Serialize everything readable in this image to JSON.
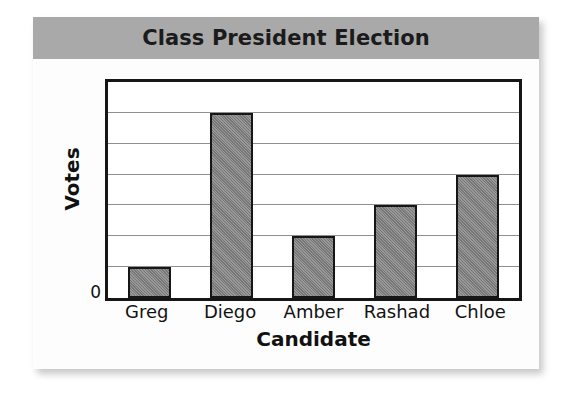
{
  "chart_data": {
    "type": "bar",
    "title": "Class President Election",
    "xlabel": "Candidate",
    "ylabel": "Votes",
    "categories": [
      "Greg",
      "Diego",
      "Amber",
      "Rashad",
      "Chloe"
    ],
    "values": [
      1,
      6,
      2,
      3,
      4
    ],
    "ylim": [
      0,
      7
    ],
    "y_tick_labels": [
      "0"
    ],
    "gridlines": 7,
    "grid": true,
    "legend": "none",
    "bar_color": "#848484",
    "bar_border_color": "#161616",
    "title_banner_color": "#a9a9a9",
    "plot_background": "#ffffff",
    "gridline_color": "#8f8f8f"
  },
  "card": {
    "background": "#fdfdfd"
  }
}
